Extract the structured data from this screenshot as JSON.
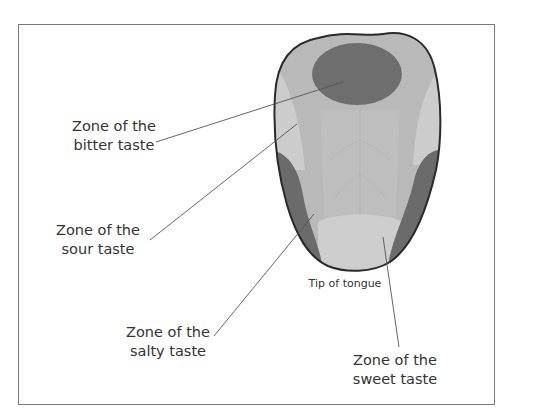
{
  "diagram": {
    "tip_label": "Tip of tongue",
    "labels": [
      {
        "id": "bitter",
        "line1": "Zone of the",
        "line2": "bitter taste"
      },
      {
        "id": "sour",
        "line1": "Zone of the",
        "line2": "sour taste"
      },
      {
        "id": "salty",
        "line1": "Zone of the",
        "line2": "salty taste"
      },
      {
        "id": "sweet",
        "line1": "Zone of the",
        "line2": "sweet taste"
      }
    ],
    "colors": {
      "tongue_base": "#b9b9b9",
      "tongue_center": "#c4c4c4",
      "sour_zone_light": "#cfcfcf",
      "bitter_zone": "#6e6e6e",
      "salty_zone": "#6b6b6b",
      "sweet_zone": "#cdcdcd",
      "outline": "#2a2a2a",
      "text": "#333333",
      "leader_line": "#555555"
    }
  }
}
